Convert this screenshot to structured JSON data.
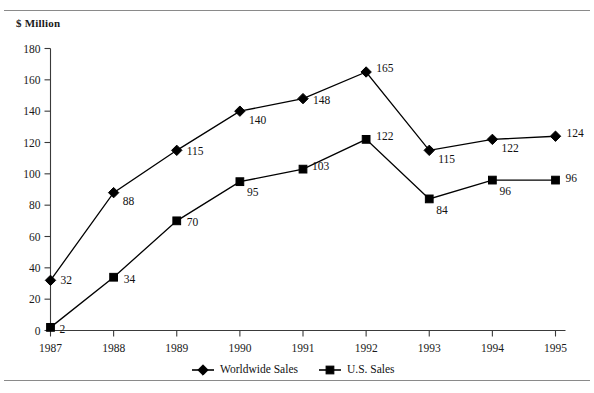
{
  "figure": {
    "title_fragment": "",
    "unit_label": "$ Million"
  },
  "legend": {
    "position": "bottom-center",
    "entries": [
      {
        "label": "Worldwide Sales",
        "marker": "diamond-marker",
        "color": "#000000"
      },
      {
        "label": "U.S. Sales",
        "marker": "square-marker",
        "color": "#000000"
      }
    ]
  },
  "chart_data": {
    "type": "line",
    "title": "",
    "xlabel": "",
    "ylabel": "$ Million",
    "categories": [
      "1987",
      "1988",
      "1989",
      "1990",
      "1991",
      "1992",
      "1993",
      "1994",
      "1995"
    ],
    "x_tick_labels": [
      "1987",
      "1988",
      "1989",
      "1990",
      "1991",
      "1992",
      "1993",
      "1994",
      "1995"
    ],
    "y_tick_labels": [
      "0",
      "20",
      "40",
      "60",
      "80",
      "100",
      "120",
      "140",
      "160",
      "180"
    ],
    "y_ticks": [
      0,
      20,
      40,
      60,
      80,
      100,
      120,
      140,
      160,
      180
    ],
    "ylim": [
      0,
      180
    ],
    "grid": false,
    "legend_position": "bottom-center",
    "series": [
      {
        "name": "Worldwide Sales",
        "marker": "diamond",
        "color": "#000000",
        "values": [
          32,
          88,
          115,
          140,
          148,
          165,
          115,
          122,
          124
        ],
        "data_labels": [
          "32",
          "88",
          "115",
          "140",
          "148",
          "165",
          "115",
          "122",
          "124"
        ]
      },
      {
        "name": "U.S. Sales",
        "marker": "square",
        "color": "#000000",
        "values": [
          2,
          34,
          70,
          95,
          103,
          122,
          84,
          96,
          96
        ],
        "data_labels": [
          "2",
          "34",
          "70",
          "95",
          "103",
          "122",
          "84",
          "96",
          "96"
        ]
      }
    ]
  }
}
